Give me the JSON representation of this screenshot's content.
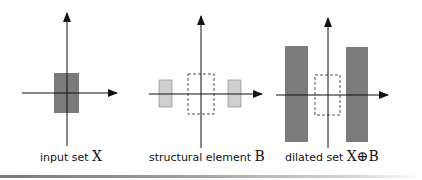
{
  "colors": {
    "dark_fill": "#7b7b7b",
    "light_fill": "#cfcfcf",
    "light_stroke": "#9a9a9a",
    "axis": "#111111",
    "dashed": "#555555"
  },
  "panels": [
    {
      "label": "input set",
      "symbol": "X"
    },
    {
      "label": "structural element",
      "symbol": "B"
    },
    {
      "label": "dilated set",
      "symbol": "X⊕B"
    }
  ]
}
